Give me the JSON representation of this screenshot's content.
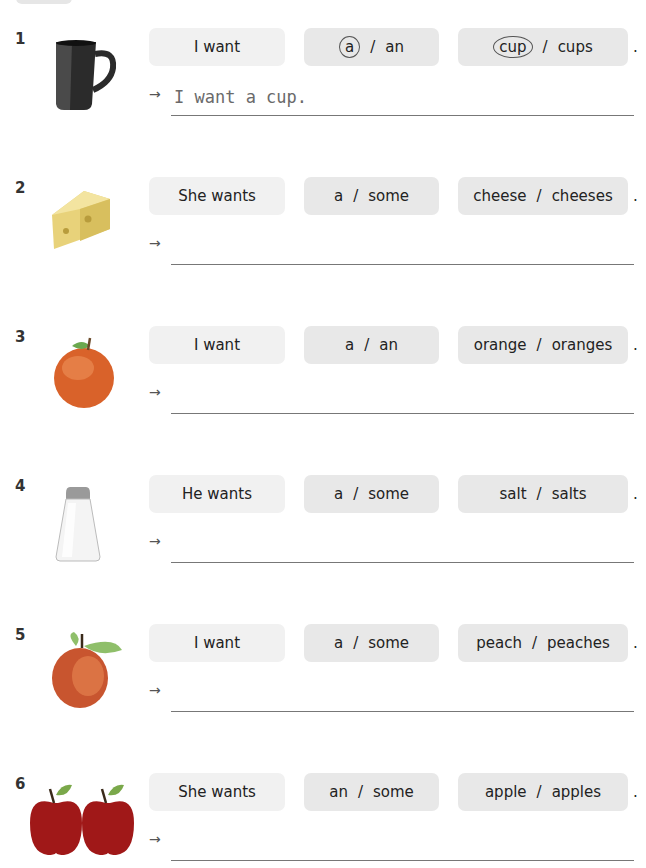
{
  "exercise": {
    "items": [
      {
        "number": "1",
        "image": "mug-icon",
        "subject": "I want",
        "article_options": [
          "a",
          "an"
        ],
        "noun_options": [
          "cup",
          "cups"
        ],
        "circled_article": "a",
        "circled_noun": "cup",
        "separator": "/",
        "end_mark": ".",
        "arrow": "→",
        "answer": "I want a cup."
      },
      {
        "number": "2",
        "image": "cheese-icon",
        "subject": "She wants",
        "article_options": [
          "a",
          "some"
        ],
        "noun_options": [
          "cheese",
          "cheeses"
        ],
        "separator": "/",
        "end_mark": ".",
        "arrow": "→",
        "answer": ""
      },
      {
        "number": "3",
        "image": "orange-icon",
        "subject": "I want",
        "article_options": [
          "a",
          "an"
        ],
        "noun_options": [
          "orange",
          "oranges"
        ],
        "separator": "/",
        "end_mark": ".",
        "arrow": "→",
        "answer": ""
      },
      {
        "number": "4",
        "image": "salt-shaker-icon",
        "subject": "He wants",
        "article_options": [
          "a",
          "some"
        ],
        "noun_options": [
          "salt",
          "salts"
        ],
        "separator": "/",
        "end_mark": ".",
        "arrow": "→",
        "answer": ""
      },
      {
        "number": "5",
        "image": "peach-icon",
        "subject": "I want",
        "article_options": [
          "a",
          "some"
        ],
        "noun_options": [
          "peach",
          "peaches"
        ],
        "separator": "/",
        "end_mark": ".",
        "arrow": "→",
        "answer": ""
      },
      {
        "number": "6",
        "image": "two-apples-icon",
        "subject": "She wants",
        "article_options": [
          "an",
          "some"
        ],
        "noun_options": [
          "apple",
          "apples"
        ],
        "separator": "/",
        "end_mark": ".",
        "arrow": "→",
        "answer": ""
      }
    ]
  },
  "colors": {
    "subject_box": "#f1f1f1",
    "option_box": "#e8e8e8",
    "answer_text": "#6a6a6a",
    "line": "#777777"
  }
}
